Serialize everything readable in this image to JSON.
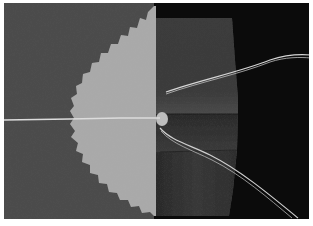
{
  "image": {
    "description": "Grayscale photograph of a sewing technique: a pinked-edge half-circle of interfacing stitched onto gray fabric, with a folded fabric panel and loose threads on a black background",
    "colors": {
      "border": "#ffffff",
      "left_fabric": "#4b4b4b",
      "background": "#0b0b0b",
      "right_panel": "#3a3a3a",
      "right_panel_fold": "#2c2c2c",
      "interfacing": "#a9a9a9",
      "thread": "#d8d8d8"
    }
  }
}
